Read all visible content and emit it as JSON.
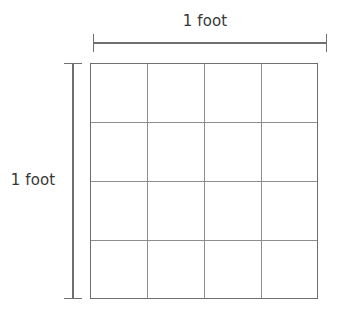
{
  "figure": {
    "type": "geometry-diagram",
    "background_color": "#ffffff"
  },
  "dimensions": {
    "top": {
      "label": "1 foot",
      "orientation": "horizontal",
      "icon": "dimension-line-icon"
    },
    "left": {
      "label": "1 foot",
      "orientation": "vertical",
      "icon": "dimension-line-icon"
    }
  },
  "grid": {
    "rows": 4,
    "columns": 4,
    "cell_count": 16,
    "line_color": "#8d8d8d",
    "border_color": "#6f6f6f",
    "fill_color": "#ffffff",
    "x_left": 90,
    "x_right": 318,
    "y_top": 63,
    "y_bottom": 299,
    "column_x": [
      90,
      147,
      204,
      261,
      318
    ],
    "row_y": [
      63,
      122,
      181,
      240,
      299
    ]
  },
  "dimension_geometry": {
    "top_line": {
      "y": 43,
      "x_start": 93,
      "x_end": 327,
      "cap_half_length": 9
    },
    "left_line": {
      "x": 73,
      "y_start": 63,
      "y_end": 299,
      "cap_half_length": 9
    },
    "stroke_color": "#6f6f6f",
    "stroke_width": 1.2
  }
}
